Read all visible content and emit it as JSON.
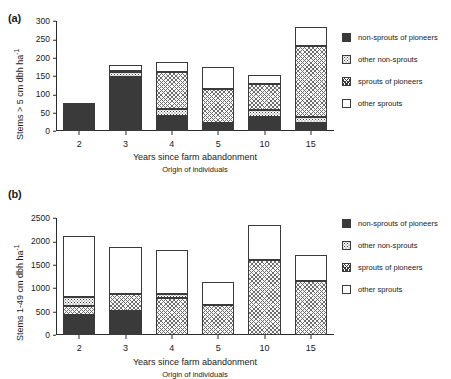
{
  "figure": {
    "panels": [
      {
        "tag": "(a)",
        "ylabel": "Stems > 5 cm dbh ha-1",
        "xlabel": "Years since farm abandonment",
        "xsublabel": "Origin of individuals"
      },
      {
        "tag": "(b)",
        "ylabel": "Stems 1-49 cm dbh ha-1",
        "xlabel": "Years since farm abandonment",
        "xsublabel": "Origin of individuals"
      }
    ],
    "legend": {
      "items": [
        {
          "label": "non-sprouts of pioneers",
          "pattern": "solid-dark",
          "color": "#3a3a3a"
        },
        {
          "label": "other non-sprouts",
          "pattern": "fine-dots",
          "color": "#3f3f3f"
        },
        {
          "label": "sprouts of pioneers",
          "pattern": "cross-hatch",
          "color": "#6d6d6d"
        },
        {
          "label": "other sprouts",
          "pattern": "empty-white",
          "color": "#ffffff"
        }
      ]
    }
  },
  "chart_data": [
    {
      "type": "bar",
      "stacked": true,
      "panel": "(a)",
      "title": "",
      "xlabel": "Years since farm abandonment",
      "xsublabel": "Origin of individuals",
      "ylabel": "Stems > 5 cm dbh ha-1",
      "categories": [
        "2",
        "3",
        "4",
        "5",
        "10",
        "15"
      ],
      "yticks": [
        0,
        50,
        100,
        150,
        200,
        250,
        300
      ],
      "ylim": [
        0,
        300
      ],
      "grid": false,
      "legend_position": "right",
      "series": [
        {
          "name": "non-sprouts of pioneers",
          "values": [
            70,
            148,
            40,
            22,
            38,
            22
          ]
        },
        {
          "name": "other non-sprouts",
          "values": [
            5,
            12,
            20,
            0,
            18,
            16
          ]
        },
        {
          "name": "sprouts of pioneers",
          "values": [
            0,
            3,
            100,
            93,
            72,
            193
          ]
        },
        {
          "name": "other sprouts",
          "values": [
            0,
            18,
            28,
            60,
            24,
            52
          ]
        }
      ],
      "totals": [
        75,
        181,
        188,
        175,
        152,
        283
      ]
    },
    {
      "type": "bar",
      "stacked": true,
      "panel": "(b)",
      "title": "",
      "xlabel": "Years since farm abandonment",
      "xsublabel": "Origin of individuals",
      "ylabel": "Stems 1-49 cm dbh ha-1",
      "categories": [
        "2",
        "3",
        "4",
        "5",
        "10",
        "15"
      ],
      "yticks": [
        0,
        500,
        1000,
        1500,
        2000,
        2500
      ],
      "ylim": [
        0,
        2500
      ],
      "grid": false,
      "legend_position": "right",
      "series": [
        {
          "name": "non-sprouts of pioneers",
          "values": [
            430,
            520,
            0,
            0,
            0,
            0
          ]
        },
        {
          "name": "sprouts of pioneers",
          "values": [
            190,
            350,
            800,
            650,
            1600,
            1150
          ]
        },
        {
          "name": "other non-sprouts",
          "values": [
            200,
            0,
            70,
            0,
            0,
            0
          ]
        },
        {
          "name": "other sprouts",
          "values": [
            1300,
            1010,
            950,
            480,
            750,
            570
          ]
        }
      ],
      "totals": [
        2120,
        1880,
        1820,
        1130,
        2350,
        1720
      ]
    }
  ]
}
